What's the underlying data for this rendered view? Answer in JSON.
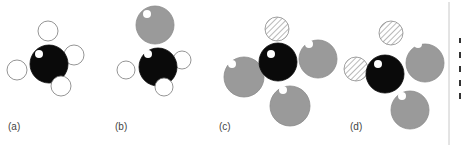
{
  "figure": {
    "colors": {
      "carbon": "#0a0a0a",
      "hydrogen": "#ffffff",
      "halogen_gray": "#9a9a9a",
      "hatched_stroke": "#8a8a8a",
      "outline": "#7a7a7a",
      "highlight": "#ffffff",
      "rule": "#c8c8c8",
      "label": "#444444"
    },
    "panels": [
      {
        "label": "(a)",
        "label_pos": [
          8,
          121
        ],
        "atoms": [
          {
            "type": "hydrogen",
            "cx": 48,
            "cy": 31,
            "r": 10
          },
          {
            "type": "hydrogen",
            "cx": 74,
            "cy": 55,
            "r": 10
          },
          {
            "type": "hydrogen",
            "cx": 17,
            "cy": 70,
            "r": 10
          },
          {
            "type": "carbon",
            "cx": 49,
            "cy": 64,
            "r": 19,
            "hl": [
              39,
              54,
              4
            ]
          },
          {
            "type": "hydrogen",
            "cx": 61,
            "cy": 86,
            "r": 10
          }
        ]
      },
      {
        "label": "(b)",
        "label_pos": [
          115,
          121
        ],
        "atoms": [
          {
            "type": "halogen",
            "cx": 155,
            "cy": 25,
            "r": 19,
            "hl": [
              147,
              14,
              4
            ]
          },
          {
            "type": "hydrogen",
            "cx": 182,
            "cy": 60,
            "r": 9
          },
          {
            "type": "hydrogen",
            "cx": 126,
            "cy": 70,
            "r": 9
          },
          {
            "type": "carbon",
            "cx": 158,
            "cy": 67,
            "r": 19,
            "hl": [
              148,
              54,
              4
            ]
          },
          {
            "type": "hydrogen",
            "cx": 164,
            "cy": 87,
            "r": 9
          }
        ]
      },
      {
        "label": "(c)",
        "label_pos": [
          219,
          121
        ],
        "atoms": [
          {
            "type": "hatched",
            "cx": 277,
            "cy": 29,
            "r": 12
          },
          {
            "type": "halogen",
            "cx": 318,
            "cy": 59,
            "r": 19,
            "hl": [
              309,
              44,
              4
            ]
          },
          {
            "type": "halogen",
            "cx": 244,
            "cy": 77,
            "r": 20,
            "hl": [
              232,
              64,
              4
            ]
          },
          {
            "type": "carbon",
            "cx": 278,
            "cy": 62,
            "r": 19,
            "hl": [
              271,
              54,
              4
            ]
          },
          {
            "type": "halogen",
            "cx": 290,
            "cy": 106,
            "r": 20,
            "hl": [
              283,
              90,
              4
            ]
          }
        ]
      },
      {
        "label": "(d)",
        "label_pos": [
          350,
          121
        ],
        "atoms": [
          {
            "type": "hatched",
            "cx": 391,
            "cy": 33,
            "r": 12
          },
          {
            "type": "hatched",
            "cx": 356,
            "cy": 69,
            "r": 12
          },
          {
            "type": "halogen",
            "cx": 425,
            "cy": 63,
            "r": 19,
            "hl": [
              418,
              44,
              4
            ]
          },
          {
            "type": "carbon",
            "cx": 385,
            "cy": 74,
            "r": 19,
            "hl": [
              378,
              64,
              4
            ]
          },
          {
            "type": "halogen",
            "cx": 410,
            "cy": 110,
            "r": 19,
            "hl": [
              402,
              96,
              4
            ]
          }
        ]
      }
    ],
    "side_rule": {
      "x": 449,
      "y1": 2,
      "y2": 145,
      "ticks": [
        {
          "x": 459,
          "y": 38,
          "w": 2,
          "h": 5
        },
        {
          "x": 459,
          "y": 52,
          "w": 2,
          "h": 6
        },
        {
          "x": 459,
          "y": 66,
          "w": 2,
          "h": 6
        },
        {
          "x": 459,
          "y": 80,
          "w": 2,
          "h": 6
        },
        {
          "x": 459,
          "y": 93,
          "w": 2,
          "h": 6
        }
      ]
    }
  }
}
